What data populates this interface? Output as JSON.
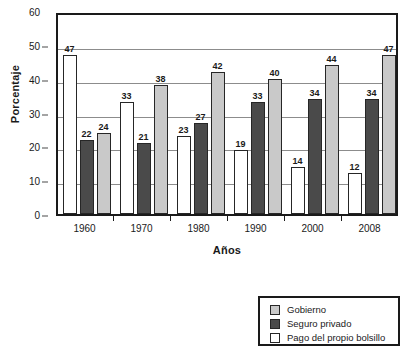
{
  "chart_data": {
    "type": "bar",
    "title": "",
    "xlabel": "Años",
    "ylabel": "Porcentaje",
    "categories": [
      "1960",
      "1970",
      "1980",
      "1990",
      "2000",
      "2008"
    ],
    "series": [
      {
        "name": "Pago del propio bolsillo",
        "key": "bolsillo",
        "color": "#ffffff",
        "values": [
          47,
          33,
          23,
          19,
          14,
          12
        ]
      },
      {
        "name": "Seguro privado",
        "key": "seguro",
        "color": "#4a4a4a",
        "values": [
          22,
          21,
          27,
          33,
          34,
          34
        ]
      },
      {
        "name": "Gobierno",
        "key": "gobierno",
        "color": "#c9c9c9",
        "values": [
          24,
          38,
          42,
          40,
          44,
          47
        ]
      }
    ],
    "ylim": [
      0,
      60
    ],
    "yticks": [
      0,
      10,
      20,
      30,
      40,
      50,
      60
    ],
    "grid": true,
    "legend_position": "bottom-right",
    "bar_order_in_group": [
      "bolsillo",
      "seguro",
      "gobierno"
    ]
  },
  "legend": {
    "items": [
      {
        "label": "Gobierno",
        "swatch": "gobierno"
      },
      {
        "label": "Seguro privado",
        "swatch": "seguro"
      },
      {
        "label": "Pago del propio bolsillo",
        "swatch": "bolsillo"
      }
    ]
  }
}
